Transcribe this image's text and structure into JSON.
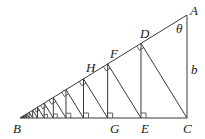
{
  "labels": {
    "A": "A",
    "B": "B",
    "C": "C",
    "D": "D",
    "E": "E",
    "F": "F",
    "G": "G",
    "H": "H",
    "theta": "θ",
    "b": "b"
  },
  "colors": {
    "line": "#3a3a3a",
    "text": "#222222",
    "background": "#ffffff"
  }
}
